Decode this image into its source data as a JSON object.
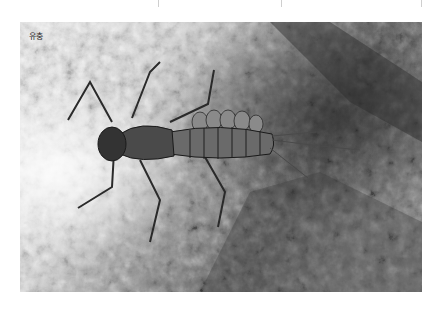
{
  "figure": {
    "label": "유충",
    "color_mode": "grayscale"
  },
  "top_separators": [
    158,
    281,
    421
  ]
}
